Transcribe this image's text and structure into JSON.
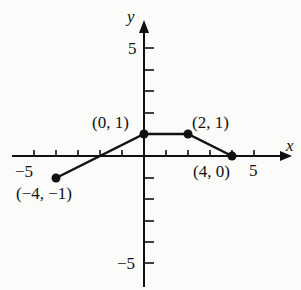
{
  "graph": {
    "axes": {
      "x_label": "x",
      "y_label": "y",
      "x_range": [
        -6,
        6
      ],
      "y_range": [
        -6,
        6
      ]
    },
    "tick_labels": {
      "x_neg": "−5",
      "x_pos": "5",
      "y_pos": "5",
      "y_neg": "−5"
    },
    "points": [
      {
        "label": "(−4, −1)",
        "x": -4,
        "y": -1
      },
      {
        "label": "(0, 1)",
        "x": 0,
        "y": 1
      },
      {
        "label": "(2, 1)",
        "x": 2,
        "y": 1
      },
      {
        "label": "(4, 0)",
        "x": 4,
        "y": 0
      }
    ],
    "colors": {
      "ink": "#111111",
      "background": "#fbfbf9"
    }
  }
}
